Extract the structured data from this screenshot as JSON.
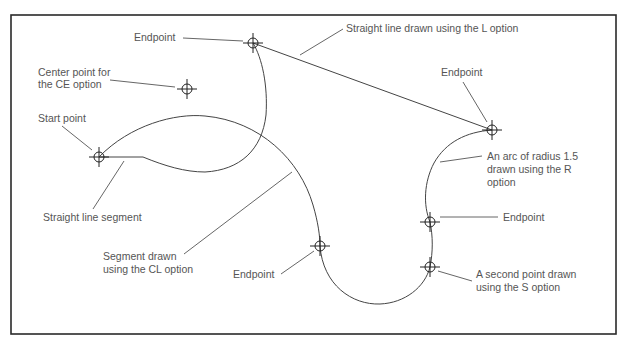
{
  "diagram": {
    "frame": {
      "x": 11,
      "y": 15,
      "width": 605,
      "height": 319,
      "color": "#2a2a2a"
    },
    "colors": {
      "curve": "#444444",
      "leader": "#555555",
      "text": "#555555",
      "marker": "#222222"
    },
    "labels": {
      "endpoint_top": "Endpoint",
      "straight_line_L": "Straight line drawn using the L option",
      "center_point_1": "Center point for",
      "center_point_2": "the CE option",
      "endpoint_right": "Endpoint",
      "start_point": "Start point",
      "arc_radius_1": "An arc of radius 1.5",
      "arc_radius_2": "drawn using the R",
      "arc_radius_3": "option",
      "endpoint_lower_right": "Endpoint",
      "straight_segment": "Straight line segment",
      "segment_cl_1": "Segment drawn",
      "segment_cl_2": "using the CL option",
      "endpoint_bottom": "Endpoint",
      "second_point_1": "A second point drawn",
      "second_point_2": "using the S option"
    },
    "points": [
      {
        "name": "start-point",
        "x": 99,
        "y": 157
      },
      {
        "name": "endpoint-top",
        "x": 253,
        "y": 43
      },
      {
        "name": "ce-center-point",
        "x": 187,
        "y": 89
      },
      {
        "name": "endpoint-right",
        "x": 492,
        "y": 130
      },
      {
        "name": "endpoint-bottom",
        "x": 320,
        "y": 246
      },
      {
        "name": "endpoint-lower-right",
        "x": 430,
        "y": 222
      },
      {
        "name": "second-point-s",
        "x": 430,
        "y": 267
      }
    ]
  }
}
